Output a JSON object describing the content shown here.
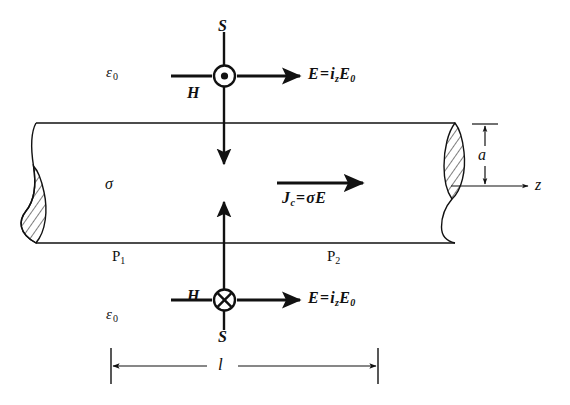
{
  "figure": {
    "colors": {
      "ink": "#111111",
      "background": "#ffffff",
      "hatch": "#111111"
    }
  },
  "medium": {
    "outside_top_label": "ε",
    "outside_top_sub": "0",
    "outside_bottom_label": "ε",
    "outside_bottom_sub": "0",
    "conductor_label": "σ"
  },
  "top_group": {
    "poynting_label": "S",
    "magnetic_label": "H",
    "magnetic_direction": "out-of-page",
    "efield": {
      "vector": "E",
      "equals": "=",
      "unit": "i",
      "unit_sub": "z",
      "magnitude": "E",
      "magnitude_sub": "0"
    }
  },
  "bottom_group": {
    "poynting_label": "S",
    "magnetic_label": "H",
    "magnetic_direction": "into-page",
    "efield": {
      "vector": "E",
      "equals": "=",
      "unit": "i",
      "unit_sub": "z",
      "magnitude": "E",
      "magnitude_sub": "0"
    }
  },
  "current": {
    "symbol": "J",
    "symbol_sub": "c",
    "equals": "=",
    "conductivity": "σ",
    "field": "E"
  },
  "terminals": {
    "left": "P",
    "left_sub": "1",
    "right": "P",
    "right_sub": "2"
  },
  "axes": {
    "axis_label": "z",
    "radius_label": "a",
    "length_label": "l"
  }
}
